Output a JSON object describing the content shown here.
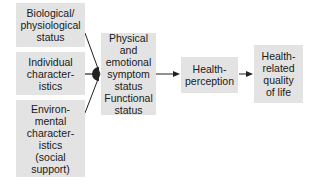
{
  "diagram": {
    "inputs": [
      {
        "label": "Biological/\nphysiological\nstatus"
      },
      {
        "label": "Individual\ncharacter-\nistics"
      },
      {
        "label": "Environ-\nmental\ncharacter-\nistics\n(social\nsupport)"
      }
    ],
    "symptom_status": {
      "label": "Physical and\nemotional\nsymptom\nstatus\nFunctional\nstatus"
    },
    "health_perception": {
      "label": "Health-\nperception"
    },
    "quality_of_life": {
      "label": "Health-\nrelated\nquality\nof life"
    }
  }
}
